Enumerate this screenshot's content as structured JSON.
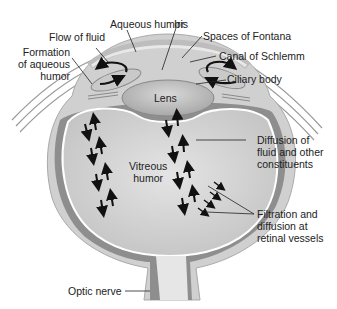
{
  "diagram": {
    "labels": {
      "aqueous_humor": "Aqueous humor",
      "iris": "Iris",
      "flow_of_fluid": "Flow of fluid",
      "spaces_of_fontana": "Spaces of Fontana",
      "formation_line1": "Formation",
      "formation_line2": "of aqueous",
      "formation_line3": "humor",
      "canal_of_schlemm": "Canal of Schlemm",
      "ciliary_body": "Ciliary body",
      "lens": "Lens",
      "vitreous_line1": "Vitreous",
      "vitreous_line2": "humor",
      "diffusion_line1": "Diffusion of",
      "diffusion_line2": "fluid and other",
      "diffusion_line3": "constituents",
      "filtration_line1": "Filtration and",
      "filtration_line2": "diffusion at",
      "filtration_line3": "retinal vessels",
      "optic_nerve": "Optic nerve"
    },
    "colors": {
      "sclera": "#c8c8c8",
      "choroid": "#8a8a8a",
      "vitreous": "#d4d4d4",
      "lens": "#bdbdbd",
      "arrow": "#111111"
    }
  }
}
